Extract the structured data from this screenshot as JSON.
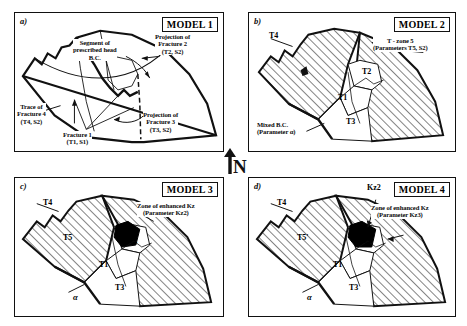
{
  "figure": {
    "compass": {
      "name": "north-arrow",
      "letter": "N"
    },
    "hatch_color": "#111111",
    "fill_black": "#000000",
    "line_color": "#111111"
  },
  "panels": [
    {
      "id": "a",
      "tag": "a)",
      "model_label": "MODEL 1",
      "annotations": [
        {
          "name": "segment-prescribed-head-bc",
          "lines": [
            "Segment of",
            "prescribed head",
            "B.C."
          ]
        },
        {
          "name": "projection-fracture-2",
          "lines": [
            "Projection of",
            "Fracture 2",
            "(T2, S2)"
          ]
        },
        {
          "name": "trace-fracture-4",
          "lines": [
            "Trace of",
            "Fracture 4",
            "(T4, S2)"
          ]
        },
        {
          "name": "fracture-1",
          "lines": [
            "Fracture 1",
            "(T1, S1)"
          ]
        },
        {
          "name": "projection-fracture-3",
          "lines": [
            "Projection of",
            "Fracture 3",
            "(T3, S2)"
          ]
        }
      ],
      "zones": []
    },
    {
      "id": "b",
      "tag": "b)",
      "model_label": "MODEL 2",
      "annotations": [
        {
          "name": "t-zone-5",
          "lines": [
            "T - zone 5",
            "(Parameters T5, S2)"
          ]
        },
        {
          "name": "mixed-bc",
          "lines": [
            "Mixed B.C.",
            "(Parameter α)"
          ]
        }
      ],
      "zones": [
        {
          "name": "zone-t4",
          "label": "T4"
        },
        {
          "name": "zone-t2",
          "label": "T2"
        },
        {
          "name": "zone-t1",
          "label": "T1"
        },
        {
          "name": "zone-t3",
          "label": "T3"
        }
      ]
    },
    {
      "id": "c",
      "tag": "c)",
      "model_label": "MODEL 3",
      "annotations": [
        {
          "name": "zone-enhanced-kz",
          "lines": [
            "Zone of enhanced Kz",
            "(Parameter Kz2)"
          ]
        },
        {
          "name": "alpha-symbol",
          "lines": [
            "α"
          ]
        }
      ],
      "zones": [
        {
          "name": "zone-t4",
          "label": "T4"
        },
        {
          "name": "zone-t5",
          "label": "T5"
        },
        {
          "name": "zone-t2",
          "label": "T2"
        },
        {
          "name": "zone-t1",
          "label": "T1"
        },
        {
          "name": "zone-t3",
          "label": "T3"
        }
      ]
    },
    {
      "id": "d",
      "tag": "d)",
      "model_label": "MODEL 4",
      "annotations": [
        {
          "name": "kz2-pointer",
          "lines": [
            "Kz2"
          ]
        },
        {
          "name": "zone-enhanced-kz",
          "lines": [
            "Zone of enhanced Kz",
            "(Parameter Kz3)"
          ]
        },
        {
          "name": "alpha-symbol",
          "lines": [
            "α"
          ]
        }
      ],
      "zones": [
        {
          "name": "zone-t4",
          "label": "T4"
        },
        {
          "name": "zone-t5-prime",
          "label": "T5'"
        },
        {
          "name": "zone-t2",
          "label": "T2"
        },
        {
          "name": "zone-t1",
          "label": "T1"
        },
        {
          "name": "zone-t3",
          "label": "T3"
        }
      ]
    }
  ]
}
